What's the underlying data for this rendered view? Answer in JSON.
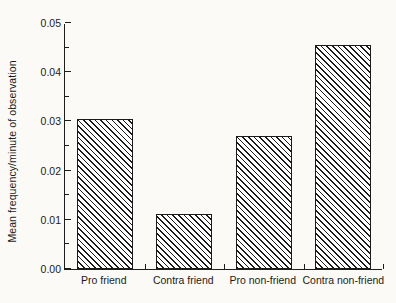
{
  "chart_data": {
    "type": "bar",
    "title": "",
    "subtitle": "",
    "xlabel": "",
    "ylabel": "Mean frequency/minute of observation",
    "categories": [
      "Pro friend",
      "Contra friend",
      "Pro non-friend",
      "Contra non-friend"
    ],
    "values": [
      0.0304,
      0.0112,
      0.027,
      0.0456
    ],
    "ylim": [
      0.0,
      0.05
    ],
    "ytick_labels": [
      "0.00",
      "0.01",
      "0.02",
      "0.03",
      "0.04",
      "0.05"
    ],
    "ytick_values": [
      0.0,
      0.01,
      0.02,
      0.03,
      0.04,
      0.05
    ],
    "yminor_values": [
      0.005,
      0.015,
      0.025,
      0.035,
      0.045
    ],
    "grid": false,
    "legend": null,
    "bar_fill": "hatched-diagonal",
    "bar_edge_color": "#1a1a1a",
    "axis_color": "#1d1d1d",
    "background_color": "#fbfaf6",
    "annotations": []
  }
}
